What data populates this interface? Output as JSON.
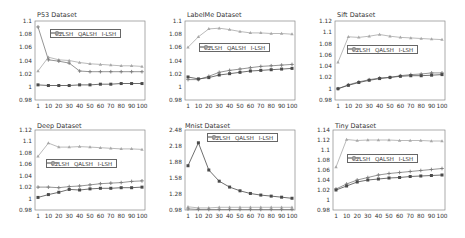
{
  "colors": {
    "c2lsh": "#4a4a4a",
    "qalsh": "#7a7a7a",
    "ilsh": "#a8a8a8",
    "axis": "#888888"
  },
  "legend": [
    "C2LSH",
    "QALSH",
    "I-LSH"
  ],
  "chart_data": [
    {
      "type": "line",
      "title": "P53 Dataset",
      "x": [
        "1",
        "10",
        "20",
        "30",
        "40",
        "50",
        "60",
        "70",
        "80",
        "90",
        "100"
      ],
      "yticks": [
        "0.98",
        "1",
        "1.02",
        "1.04",
        "1.06",
        "1.08",
        "1.1"
      ],
      "ylim": [
        0.98,
        1.1
      ],
      "legend_position": "top-right inside",
      "series": [
        {
          "name": "C2LSH",
          "values": [
            1.003,
            1.002,
            1.002,
            1.002,
            1.003,
            1.003,
            1.004,
            1.004,
            1.005,
            1.005,
            1.005
          ]
        },
        {
          "name": "QALSH",
          "values": [
            1.091,
            1.041,
            1.039,
            1.036,
            1.024,
            1.023,
            1.023,
            1.023,
            1.023,
            1.023,
            1.023
          ]
        },
        {
          "name": "I-LSH",
          "values": [
            1.024,
            1.045,
            1.041,
            1.04,
            1.037,
            1.035,
            1.034,
            1.033,
            1.032,
            1.032,
            1.031
          ]
        }
      ]
    },
    {
      "type": "line",
      "title": "LabelMe Dataset",
      "x": [
        "1",
        "10",
        "20",
        "30",
        "40",
        "50",
        "60",
        "70",
        "80",
        "90",
        "100"
      ],
      "yticks": [
        "0.98",
        "1",
        "1.02",
        "1.04",
        "1.06",
        "1.08",
        "1.1"
      ],
      "ylim": [
        0.98,
        1.1
      ],
      "legend_position": "middle inside",
      "series": [
        {
          "name": "C2LSH",
          "values": [
            1.015,
            1.012,
            1.014,
            1.018,
            1.02,
            1.022,
            1.024,
            1.025,
            1.026,
            1.027,
            1.028
          ]
        },
        {
          "name": "QALSH",
          "values": [
            1.011,
            1.011,
            1.016,
            1.022,
            1.025,
            1.027,
            1.029,
            1.031,
            1.032,
            1.033,
            1.034
          ]
        },
        {
          "name": "I-LSH",
          "values": [
            1.06,
            1.076,
            1.088,
            1.089,
            1.087,
            1.084,
            1.082,
            1.082,
            1.081,
            1.081,
            1.08
          ]
        }
      ]
    },
    {
      "type": "line",
      "title": "Sift Dataset",
      "x": [
        "1",
        "10",
        "20",
        "30",
        "40",
        "50",
        "60",
        "70",
        "80",
        "90",
        "100"
      ],
      "yticks": [
        "0.98",
        "1",
        "1.02",
        "1.04",
        "1.06",
        "1.08",
        "1.1",
        "1.12"
      ],
      "ylim": [
        0.98,
        1.12
      ],
      "legend_position": "middle inside",
      "series": [
        {
          "name": "C2LSH",
          "values": [
            1.0,
            1.006,
            1.011,
            1.015,
            1.018,
            1.02,
            1.022,
            1.023,
            1.023,
            1.024,
            1.025
          ]
        },
        {
          "name": "QALSH",
          "values": [
            1.0,
            1.007,
            1.012,
            1.016,
            1.019,
            1.02,
            1.023,
            1.025,
            1.026,
            1.028,
            1.028
          ]
        },
        {
          "name": "I-LSH",
          "values": [
            1.047,
            1.092,
            1.091,
            1.093,
            1.096,
            1.093,
            1.091,
            1.09,
            1.089,
            1.088,
            1.087
          ]
        }
      ]
    },
    {
      "type": "line",
      "title": "Deep Dataset",
      "x": [
        "1",
        "10",
        "20",
        "30",
        "40",
        "50",
        "60",
        "70",
        "80",
        "90",
        "100"
      ],
      "yticks": [
        "0.98",
        "1",
        "1.02",
        "1.04",
        "1.06",
        "1.08",
        "1.1",
        "1.12"
      ],
      "ylim": [
        0.98,
        1.12
      ],
      "legend_position": "middle inside",
      "series": [
        {
          "name": "C2LSH",
          "values": [
            1.002,
            1.007,
            1.011,
            1.016,
            1.015,
            1.017,
            1.018,
            1.018,
            1.019,
            1.019,
            1.02
          ]
        },
        {
          "name": "QALSH",
          "values": [
            1.02,
            1.02,
            1.019,
            1.021,
            1.022,
            1.024,
            1.026,
            1.027,
            1.028,
            1.03,
            1.031
          ]
        },
        {
          "name": "I-LSH",
          "values": [
            1.074,
            1.097,
            1.09,
            1.09,
            1.091,
            1.09,
            1.089,
            1.088,
            1.087,
            1.087,
            1.086
          ]
        }
      ]
    },
    {
      "type": "line",
      "title": "Mnist Dataset",
      "x": [
        "1",
        "10",
        "20",
        "30",
        "40",
        "50",
        "60",
        "70",
        "80",
        "90",
        "100"
      ],
      "yticks": [
        "0.98",
        "1.28",
        "1.58",
        "1.88",
        "2.18",
        "2.48"
      ],
      "ylim": [
        0.98,
        2.48
      ],
      "legend_position": "top-right inside",
      "series": [
        {
          "name": "C2LSH",
          "values": [
            1.81,
            2.24,
            1.73,
            1.52,
            1.41,
            1.34,
            1.29,
            1.26,
            1.24,
            1.22,
            1.2
          ]
        },
        {
          "name": "QALSH",
          "values": [
            1.0,
            0.99,
            0.99,
            0.99,
            0.99,
            0.99,
            0.99,
            0.99,
            0.99,
            0.99,
            0.99
          ]
        },
        {
          "name": "I-LSH",
          "values": [
            1.04,
            1.02,
            1.02,
            1.03,
            1.03,
            1.03,
            1.03,
            1.03,
            1.03,
            1.03,
            1.03
          ]
        }
      ]
    },
    {
      "type": "line",
      "title": "Tiny Dataset",
      "x": [
        "1",
        "10",
        "20",
        "30",
        "40",
        "50",
        "60",
        "70",
        "80",
        "90",
        "100"
      ],
      "yticks": [
        "0.98",
        "1",
        "1.02",
        "1.04",
        "1.06",
        "1.08",
        "1.1",
        "1.12",
        "1.14"
      ],
      "ylim": [
        0.98,
        1.14
      ],
      "legend_position": "middle inside",
      "series": [
        {
          "name": "C2LSH",
          "values": [
            1.02,
            1.028,
            1.036,
            1.04,
            1.042,
            1.044,
            1.045,
            1.047,
            1.048,
            1.049,
            1.05
          ]
        },
        {
          "name": "QALSH",
          "values": [
            1.022,
            1.032,
            1.04,
            1.045,
            1.05,
            1.053,
            1.055,
            1.057,
            1.059,
            1.061,
            1.063
          ]
        },
        {
          "name": "I-LSH",
          "values": [
            1.066,
            1.121,
            1.119,
            1.12,
            1.12,
            1.12,
            1.119,
            1.119,
            1.119,
            1.118,
            1.118
          ]
        }
      ]
    }
  ]
}
